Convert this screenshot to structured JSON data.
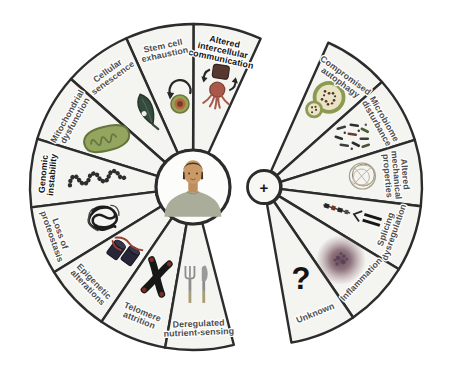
{
  "figure": {
    "background": "#ffffff",
    "colors": {
      "sector_fill": "#f4f4f1",
      "outline": "#2c2c2c",
      "label_gray": "#4e4e4e",
      "label_black": "#141414",
      "olive_green": "#8c9b52",
      "dark_leaf_green": "#344a3c",
      "cell_red_brown": "#a8594a",
      "histone_navy": "#262638",
      "inflammation_purple": "#6d4a58"
    },
    "left_wheel": {
      "center_icon": "human-bust-icon",
      "sectors": [
        {
          "label": "Altered intercellular communication",
          "lines": [
            "Altered",
            "intercellular",
            "communication"
          ],
          "icon": "intercellular-communication-icon",
          "emphasis": true
        },
        {
          "label": "Stem cell exhaustion",
          "lines": [
            "Stem cell",
            "exhaustion"
          ],
          "icon": "stem-cell-icon",
          "emphasis": false
        },
        {
          "label": "Cellular senescence",
          "lines": [
            "Cellular",
            "senescence"
          ],
          "icon": "senescent-leaf-icon",
          "emphasis": false
        },
        {
          "label": "Mitochondrial dysfunction",
          "lines": [
            "Mitochondrial",
            "dysfunction"
          ],
          "icon": "mitochondrion-icon",
          "emphasis": false
        },
        {
          "label": "Genomic instability",
          "lines": [
            "Genomic",
            "instability"
          ],
          "icon": "dna-strand-icon",
          "emphasis": true
        },
        {
          "label": "Loss of proteostasis",
          "lines": [
            "Loss of",
            "proteostasis"
          ],
          "icon": "protein-tangle-icon",
          "emphasis": false
        },
        {
          "label": "Epigenetic alterations",
          "lines": [
            "Epigenetic",
            "alterations"
          ],
          "icon": "histones-icon",
          "emphasis": false
        },
        {
          "label": "Telomere attrition",
          "lines": [
            "Telomere",
            "attrition"
          ],
          "icon": "chromosome-icon",
          "emphasis": false
        },
        {
          "label": "Deregulated nutrient-sensing",
          "lines": [
            "Deregulated",
            "nutrient-sensing"
          ],
          "icon": "cutlery-icon",
          "emphasis": false
        }
      ]
    },
    "right_wheel": {
      "center_symbol": "+",
      "sectors": [
        {
          "label": "Compromised autophagy",
          "lines": [
            "Compromised",
            "autophagy"
          ],
          "icon": "autophagosome-icon",
          "emphasis": false
        },
        {
          "label": "Microbiome disturbance",
          "lines": [
            "Microbiome",
            "disturbance"
          ],
          "icon": "bacteria-icon",
          "emphasis": false
        },
        {
          "label": "Altered mechanical properties",
          "lines": [
            "Altered",
            "mechanical",
            "properties"
          ],
          "icon": "cell-mesh-icon",
          "emphasis": false
        },
        {
          "label": "Splicing dysregulation",
          "lines": [
            "Splicing",
            "dysregulation"
          ],
          "icon": "rna-splicing-icon",
          "emphasis": false
        },
        {
          "label": "Inflammation",
          "lines": [
            "Inflammation"
          ],
          "icon": "inflammation-icon",
          "emphasis": false
        },
        {
          "label": "Unknown",
          "lines": [
            "Unknown"
          ],
          "icon": "question-mark-icon",
          "symbol": "?",
          "emphasis": false
        }
      ]
    }
  }
}
